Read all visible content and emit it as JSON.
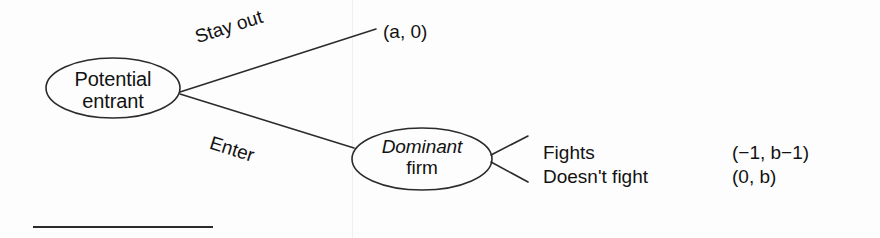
{
  "diagram": {
    "type": "game-tree",
    "background_color": "#fdfdfd",
    "line_color": "#2b2b2b",
    "nodes": [
      {
        "id": "potential-entrant",
        "label_line1": "Potential",
        "label_line2": "entrant",
        "shape": "ellipse",
        "cx": 113,
        "cy": 88,
        "rx": 67,
        "ry": 30
      },
      {
        "id": "dominant-firm",
        "label_line1": "Dominant",
        "label_line2": "firm",
        "shape": "ellipse",
        "cx": 422,
        "cy": 159,
        "rx": 70,
        "ry": 31
      }
    ],
    "edges": [
      {
        "id": "stay-out",
        "label": "Stay out",
        "from": "potential-entrant",
        "to": "payoff-stayout"
      },
      {
        "id": "enter",
        "label": "Enter",
        "from": "potential-entrant",
        "to": "dominant-firm"
      },
      {
        "id": "fights",
        "label": "Fights",
        "from": "dominant-firm",
        "to": "payoff-fights"
      },
      {
        "id": "doesnt-fight",
        "label": "Doesn't fight",
        "from": "dominant-firm",
        "to": "payoff-doesnt-fight"
      }
    ],
    "payoffs": {
      "stay_out": "(a, 0)",
      "fights": "(−1, b−1)",
      "doesnt_fight": "(0, b)"
    },
    "outcomes": [
      {
        "label": "Fights",
        "payoff": "(−1, b−1)"
      },
      {
        "label": "Doesn't fight",
        "payoff": "(0, b)"
      }
    ],
    "footnote_rule": true
  }
}
